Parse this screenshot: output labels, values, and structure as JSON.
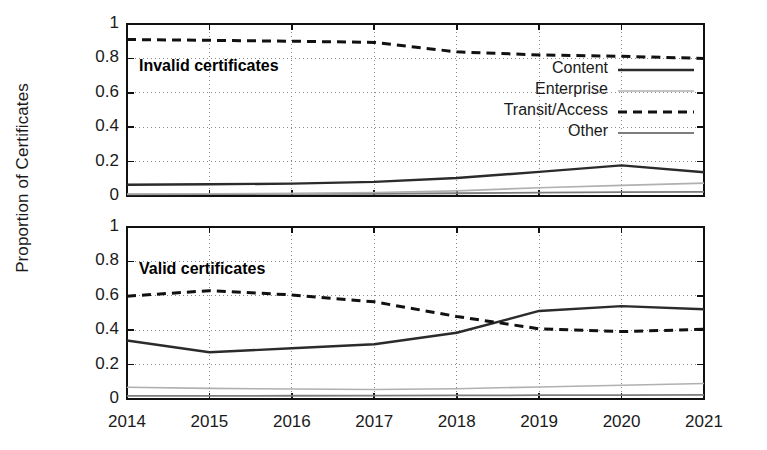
{
  "chart_data": {
    "type": "line",
    "title": "",
    "xlabel": "",
    "ylabel": "Proportion of Certificates",
    "x": [
      2014,
      2015,
      2016,
      2017,
      2018,
      2019,
      2020,
      2021
    ],
    "xtick_labels": [
      "2014",
      "2015",
      "2016",
      "2017",
      "2018",
      "2019",
      "2020",
      "2021"
    ],
    "ytick_labels": [
      "0",
      "0.2",
      "0.4",
      "0.6",
      "0.8",
      "1"
    ],
    "ytick_values": [
      0,
      0.2,
      0.4,
      0.6,
      0.8,
      1
    ],
    "ylim": [
      0,
      1
    ],
    "xlim": [
      2014,
      2021
    ],
    "grid": true,
    "legend_position": "upper-right-of-top-panel",
    "legend": [
      {
        "label": "Content",
        "style": "solid",
        "color": "#2b2b2b",
        "width": 2.4
      },
      {
        "label": "Enterprise",
        "style": "solid",
        "color": "#b0b0b0",
        "width": 1.6
      },
      {
        "label": "Transit/Access",
        "style": "dashed",
        "color": "#111111",
        "width": 3.0
      },
      {
        "label": "Other",
        "style": "solid",
        "color": "#7d7d7d",
        "width": 1.8
      }
    ],
    "panels": [
      {
        "name": "invalid",
        "title": "Invalid certificates",
        "series": [
          {
            "name": "Content",
            "values": [
              0.065,
              0.068,
              0.072,
              0.082,
              0.105,
              0.14,
              0.178,
              0.138
            ]
          },
          {
            "name": "Enterprise",
            "values": [
              0.012,
              0.013,
              0.015,
              0.02,
              0.03,
              0.048,
              0.062,
              0.075
            ]
          },
          {
            "name": "Transit/Access",
            "values": [
              0.91,
              0.905,
              0.9,
              0.893,
              0.838,
              0.82,
              0.812,
              0.8
            ]
          },
          {
            "name": "Other",
            "values": [
              0.01,
              0.011,
              0.012,
              0.013,
              0.016,
              0.02,
              0.022,
              0.024
            ]
          }
        ]
      },
      {
        "name": "valid",
        "title": "Valid certificates",
        "series": [
          {
            "name": "Content",
            "values": [
              0.34,
              0.272,
              0.295,
              0.318,
              0.385,
              0.512,
              0.54,
              0.522
            ]
          },
          {
            "name": "Enterprise",
            "values": [
              0.068,
              0.062,
              0.058,
              0.055,
              0.06,
              0.07,
              0.08,
              0.09
            ]
          },
          {
            "name": "Transit/Access",
            "values": [
              0.598,
              0.63,
              0.605,
              0.565,
              0.48,
              0.408,
              0.392,
              0.405
            ]
          },
          {
            "name": "Other",
            "values": [
              0.018,
              0.018,
              0.019,
              0.02,
              0.021,
              0.022,
              0.023,
              0.024
            ]
          }
        ]
      }
    ]
  },
  "geometry": {
    "plot_left": 127,
    "plot_right": 704,
    "top_panel_top": 24,
    "top_panel_bottom": 196,
    "bottom_panel_top": 227,
    "bottom_panel_bottom": 399
  }
}
